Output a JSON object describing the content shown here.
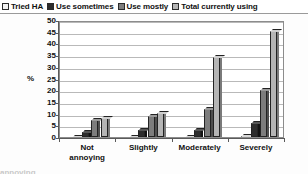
{
  "legend": {
    "position": "top",
    "entries": [
      {
        "label": "Tried HA",
        "color": "#f2f2f2",
        "icon": "square-swatch-icon"
      },
      {
        "label": "Use sometimes",
        "color": "#2d2d2d",
        "icon": "square-swatch-icon"
      },
      {
        "label": "Use mostly",
        "color": "#7d7d7d",
        "icon": "square-swatch-icon"
      },
      {
        "label": "Total currently using",
        "color": "#b5b5b5",
        "icon": "square-swatch-icon"
      }
    ]
  },
  "axes": {
    "ylabel": "%",
    "yticks": [
      "50",
      "45",
      "40",
      "35",
      "30",
      "25",
      "20",
      "15",
      "10",
      "5",
      "0"
    ],
    "xcategories": [
      "Not annoying",
      "Slightly",
      "Moderately",
      "Severely"
    ]
  },
  "chart_data": {
    "type": "bar",
    "title": "",
    "subtitle": "",
    "xlabel": "",
    "ylabel": "%",
    "ylim": [
      0,
      50
    ],
    "ytick_step": 5,
    "grid": true,
    "legend_position": "top",
    "categories": [
      "Not annoying",
      "Slightly",
      "Moderately",
      "Severely"
    ],
    "series": [
      {
        "name": "Tried HA",
        "color": "#f2f2f2",
        "values": [
          1,
          1,
          1,
          1.5
        ]
      },
      {
        "name": "Use sometimes",
        "color": "#2d2d2d",
        "values": [
          3,
          4,
          4,
          7
        ]
      },
      {
        "name": "Use mostly",
        "color": "#7d7d7d",
        "values": [
          8,
          10,
          13,
          21
        ]
      },
      {
        "name": "Total currently using",
        "color": "#b5b5b5",
        "values": [
          9,
          11,
          35,
          46
        ]
      }
    ]
  },
  "footer": {
    "cut_text": "annoying"
  }
}
